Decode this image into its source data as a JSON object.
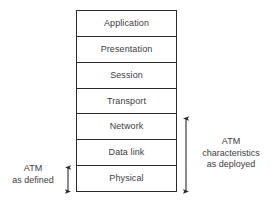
{
  "diagram": {
    "type": "layered-stack",
    "stack": {
      "name": "osi-layer-stack",
      "layers": [
        {
          "label": "Application"
        },
        {
          "label": "Presentation"
        },
        {
          "label": "Session"
        },
        {
          "label": "Transport"
        },
        {
          "label": "Network"
        },
        {
          "label": "Data link"
        },
        {
          "label": "Physical"
        }
      ]
    },
    "annotations": {
      "left": {
        "name": "atm-as-defined-annotation",
        "lines": [
          "ATM",
          "as defined"
        ],
        "spans_layers": [
          "Physical"
        ],
        "arrow": "double-headed-vertical"
      },
      "right": {
        "name": "atm-characteristics-annotation",
        "lines": [
          "ATM",
          "characteristics",
          "as deployed"
        ],
        "spans_layers": [
          "Network",
          "Data link",
          "Physical"
        ],
        "arrow": "double-headed-vertical"
      }
    },
    "colors": {
      "stroke": "#2b2b2b",
      "text": "#3d3d3d",
      "background": "#ffffff"
    }
  }
}
